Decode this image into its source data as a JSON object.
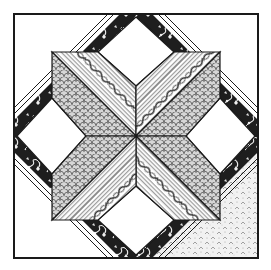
{
  "figure": {
    "alt": "Quilt block illustration: eight-pointed star with patterned diamonds framed by diagonal floral bands",
    "colors": {
      "background": "#ffffff",
      "outline": "#1a1a1a",
      "band_dark": "#222222",
      "band_floral": "#f2f2f2",
      "stripe_light": "#ffffff",
      "stripe_mid": "#9a9a9a",
      "scale_fill": "#cfcfcf",
      "stipple_fill": "#ececec"
    },
    "regions": [
      {
        "name": "star-point-striped",
        "pattern": "diagonal stripes with rope/cable motif",
        "count": 4
      },
      {
        "name": "star-point-scale",
        "pattern": "scallop/fish-scale print",
        "count": 4
      },
      {
        "name": "floral-band",
        "pattern": "dark floral vine border with striped edges",
        "count": 4
      },
      {
        "name": "white-diamond",
        "pattern": "plain white",
        "count": 4
      },
      {
        "name": "corner-triangle",
        "pattern": "plain white",
        "count": 3
      },
      {
        "name": "corner-triangle-stippled",
        "pattern": "light stipple / pebble print",
        "count": 1
      }
    ]
  }
}
